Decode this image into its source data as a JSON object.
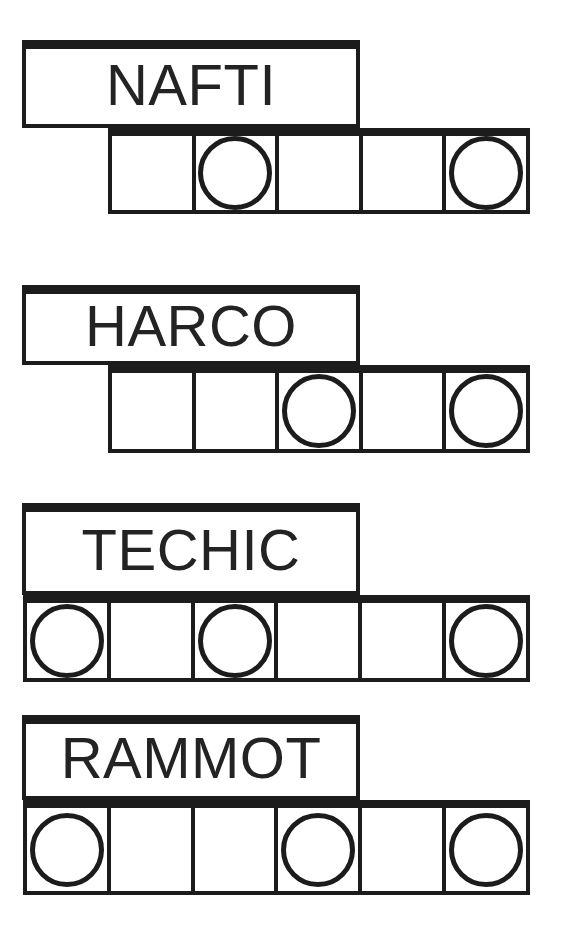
{
  "sheet": {
    "title": "word-scramble-puzzle-sheet",
    "ink_color": "#1c1c1c",
    "paper_color": "#ffffff"
  },
  "groups": [
    {
      "id": "group-nafti",
      "word": "NAFTI",
      "word_box": {
        "x": 22,
        "y": 40,
        "w": 338,
        "h": 88
      },
      "grid": {
        "x": 108,
        "y": 128,
        "w": 422,
        "h": 86,
        "cells": 5
      },
      "circles": [
        false,
        true,
        false,
        false,
        true
      ]
    },
    {
      "id": "group-harco",
      "word": "HARCO",
      "word_box": {
        "x": 22,
        "y": 285,
        "w": 338,
        "h": 80
      },
      "grid": {
        "x": 108,
        "y": 365,
        "w": 422,
        "h": 88,
        "cells": 5
      },
      "circles": [
        false,
        false,
        true,
        false,
        true
      ]
    },
    {
      "id": "group-techic",
      "word": "TECHIC",
      "word_box": {
        "x": 22,
        "y": 503,
        "w": 338,
        "h": 92
      },
      "grid": {
        "x": 23,
        "y": 595,
        "w": 507,
        "h": 87,
        "cells": 6
      },
      "circles": [
        true,
        false,
        true,
        false,
        false,
        true
      ]
    },
    {
      "id": "group-rammot",
      "word": "RAMMOT",
      "word_box": {
        "x": 22,
        "y": 715,
        "w": 338,
        "h": 85
      },
      "grid": {
        "x": 23,
        "y": 800,
        "w": 507,
        "h": 95,
        "cells": 6
      },
      "circles": [
        true,
        false,
        false,
        true,
        false,
        true
      ]
    }
  ]
}
